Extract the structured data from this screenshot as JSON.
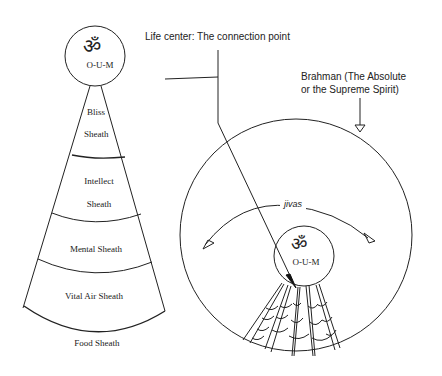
{
  "diagram": {
    "left_figure": {
      "om_symbol": "ॐ",
      "om_label": "O-U-M",
      "sheaths": [
        {
          "label_line1": "Bliss",
          "label_line2": "Sheath"
        },
        {
          "label_line1": "Intellect",
          "label_line2": "Sheath"
        },
        {
          "label_line1": "Mental Sheath"
        },
        {
          "label_line1": "Vital Air Sheath"
        },
        {
          "label_line1": "Food Sheath"
        }
      ]
    },
    "right_figure": {
      "life_center_label": "Life center: The connection point",
      "brahman_label_line1": "Brahman (The Absolute",
      "brahman_label_line2": "or the Supreme Spirit)",
      "jivas_label": "jivas",
      "om_symbol": "ॐ",
      "om_label": "O-U-M"
    }
  }
}
